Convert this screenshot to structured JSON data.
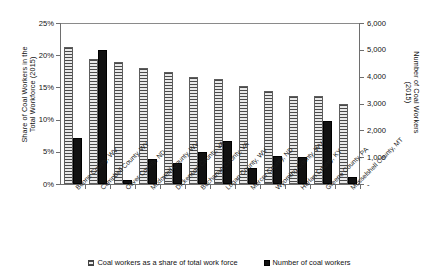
{
  "chart_data": {
    "type": "bar",
    "title": "",
    "grid": false,
    "legend_position": "bottom",
    "categories": [
      "Boone County, WV",
      "Campbell County, WY",
      "Oliver County, ND",
      "Mcdowell County, WV",
      "Dickenson County, VA",
      "Buchanan County, VA",
      "Logan County, WV",
      "Mercer County, ND",
      "Wyoming County, WV",
      "Harlan County, KY",
      "Greene County, PA",
      "Musselshell County, MT"
    ],
    "series": [
      {
        "name": "Coal workers as a share of total work force",
        "axis": "left",
        "unit": "%",
        "values": [
          21.3,
          19.4,
          19.0,
          18.0,
          17.4,
          16.6,
          16.3,
          15.2,
          14.4,
          13.6,
          13.6,
          12.5
        ]
      },
      {
        "name": "Number of coal workers",
        "axis": "right",
        "unit": "workers",
        "values": [
          1700,
          5000,
          150,
          950,
          800,
          1200,
          1600,
          600,
          1050,
          1000,
          2350,
          250
        ]
      }
    ],
    "ylabel": "Share of Coal Workers in the\nTotal Workforce (2015)",
    "y2label": "Number of Coal Workers\n(2015)",
    "xlabel": "",
    "ylim": [
      0,
      25
    ],
    "y2lim": [
      0,
      6000
    ],
    "yticks": [
      "0%",
      "5%",
      "10%",
      "15%",
      "20%",
      "25%"
    ],
    "y2ticks": [
      "-",
      "1,000",
      "2,000",
      "3,000",
      "4,000",
      "5,000",
      "6,000"
    ]
  },
  "legend": {
    "items": [
      {
        "label": "Coal workers as a share of total work force",
        "swatch": "hatched-square-icon"
      },
      {
        "label": "Number of coal workers",
        "swatch": "filled-square-icon"
      }
    ]
  }
}
